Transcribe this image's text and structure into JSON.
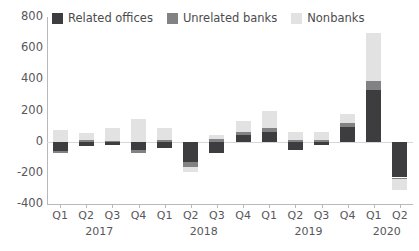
{
  "chart_data": {
    "type": "bar",
    "stacked": true,
    "orientation": "vertical",
    "title": "",
    "subtitle": "",
    "xlabel": "",
    "ylabel": "",
    "ylim": [
      -400,
      800
    ],
    "yticks": [
      800,
      600,
      400,
      200,
      0,
      -200,
      -400
    ],
    "ytick_labels": [
      "800",
      "600",
      "400",
      "200",
      "0",
      "-200",
      "-400"
    ],
    "grid": false,
    "zero_line": true,
    "legend_position": "top-left",
    "categories": [
      "Q1",
      "Q2",
      "Q3",
      "Q4",
      "Q1",
      "Q2",
      "Q3",
      "Q4",
      "Q1",
      "Q2",
      "Q3",
      "Q4",
      "Q1",
      "Q2"
    ],
    "group_labels": [
      {
        "label": "2017",
        "start": 0,
        "end": 3
      },
      {
        "label": "2018",
        "start": 4,
        "end": 7
      },
      {
        "label": "2019",
        "start": 8,
        "end": 11
      },
      {
        "label": "2020",
        "start": 12,
        "end": 13
      }
    ],
    "series": [
      {
        "name": "Related offices",
        "color": "#3d3d3f",
        "values": [
          -60,
          -25,
          -20,
          -55,
          -40,
          -130,
          -75,
          40,
          60,
          -55,
          -20,
          95,
          330,
          -230
        ]
      },
      {
        "name": "Unrelated banks",
        "color": "#828284",
        "values": [
          -15,
          10,
          5,
          -20,
          10,
          -30,
          15,
          25,
          30,
          10,
          10,
          25,
          60,
          -10
        ]
      },
      {
        "name": "Nonbanks",
        "color": "#e2e2e2",
        "values": [
          75,
          45,
          85,
          145,
          80,
          -35,
          25,
          70,
          110,
          50,
          55,
          55,
          310,
          -70
        ]
      }
    ]
  },
  "legend": {
    "items": [
      {
        "label": "Related offices",
        "color": "#3d3d3f"
      },
      {
        "label": "Unrelated banks",
        "color": "#828284"
      },
      {
        "label": "Nonbanks",
        "color": "#e2e2e2"
      }
    ]
  }
}
